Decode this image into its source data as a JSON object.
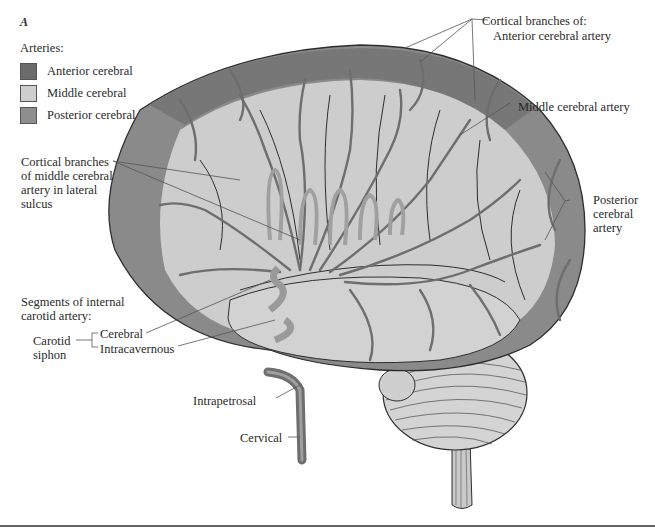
{
  "figure": {
    "panel_letter": "A",
    "legend": {
      "title": "Arteries:",
      "items": [
        {
          "label": "Anterior cerebral",
          "color": "#6b6b6b"
        },
        {
          "label": "Middle cerebral",
          "color": "#cfcfcf"
        },
        {
          "label": "Posterior cerebral",
          "color": "#8e8e8e"
        }
      ]
    },
    "labels": {
      "cortical_branches_of": "Cortical branches of:",
      "anterior_cerebral_artery": "Anterior cerebral artery",
      "middle_cerebral_artery": "Middle cerebral artery",
      "lateral_sulcus_1": "Cortical branches",
      "lateral_sulcus_2": "of middle cerebral",
      "lateral_sulcus_3": "artery in lateral",
      "lateral_sulcus_4": "sulcus",
      "posterior_1": "Posterior",
      "posterior_2": "cerebral",
      "posterior_3": "artery",
      "segments_1": "Segments of internal",
      "segments_2": "carotid artery:",
      "carotid_1": "Carotid",
      "carotid_2": "siphon",
      "cerebral": "Cerebral",
      "intracavernous": "Intracavernous",
      "intrapetrosal": "Intrapetrosal",
      "cervical": "Cervical"
    },
    "colors": {
      "anterior_region": "#7a7a7a",
      "middle_region": "#cdcdcd",
      "posterior_region": "#9a9a9a",
      "artery": "#6e6e6e",
      "outline": "#2e2e2e",
      "leader_line": "#555555"
    }
  }
}
